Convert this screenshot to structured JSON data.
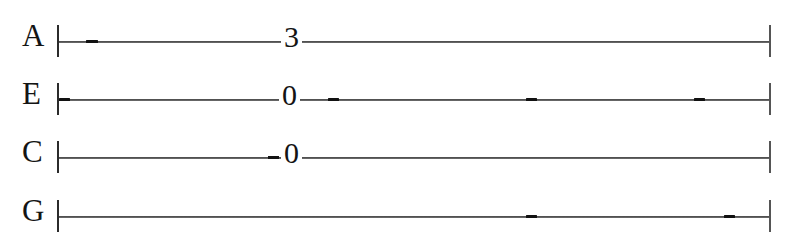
{
  "document": {
    "kind": "guitar-tablature",
    "system_count": 1,
    "background_color": "#ffffff",
    "ink_color": "#141414",
    "line_color": "#3a3a3a"
  },
  "staff": {
    "start_barline_x": 57,
    "end_barline_x": 769,
    "line_left_x": 59,
    "line_right_x": 770,
    "strings": [
      {
        "label": "A",
        "label_x": 22,
        "line_y": 41,
        "row_top": 12,
        "notes": [
          {
            "text": "3",
            "x": 281,
            "y": 22,
            "fret": 3
          }
        ],
        "prefix_dashes": [],
        "dashes": [
          {
            "x": 86,
            "width": 12
          }
        ]
      },
      {
        "label": "E",
        "label_x": 22,
        "line_y": 99,
        "row_top": 70,
        "notes": [
          {
            "text": "0",
            "x": 279,
            "y": 80,
            "fret": 0
          }
        ],
        "prefix_dashes": [],
        "dashes": [
          {
            "x": 59,
            "width": 11
          },
          {
            "x": 328,
            "width": 11
          },
          {
            "x": 526,
            "width": 11
          },
          {
            "x": 694,
            "width": 11
          }
        ]
      },
      {
        "label": "C",
        "label_x": 22,
        "line_y": 157,
        "row_top": 128,
        "notes": [
          {
            "text": "0",
            "x": 281,
            "y": 138,
            "fret": 0
          }
        ],
        "prefix_dashes": [
          {
            "x": 268,
            "width": 11
          }
        ],
        "dashes": []
      },
      {
        "label": "G",
        "label_x": 22,
        "line_y": 216,
        "row_top": 187,
        "notes": [],
        "prefix_dashes": [],
        "dashes": [
          {
            "x": 526,
            "width": 11
          },
          {
            "x": 724,
            "width": 11
          }
        ]
      }
    ]
  },
  "tab_data": {
    "tuning_top_to_bottom": [
      "A",
      "E",
      "C",
      "G"
    ],
    "lines": [
      "A|--------------------3------------------------------------|",
      "E|--------------------0---------------------------------------|",
      "C|-------------------0-------------------------------------|",
      "G|---------------------------------------------------------|"
    ],
    "notes_in_order": [
      {
        "string": "A",
        "fret": 3
      },
      {
        "string": "E",
        "fret": 0
      },
      {
        "string": "C",
        "fret": 0
      }
    ]
  }
}
